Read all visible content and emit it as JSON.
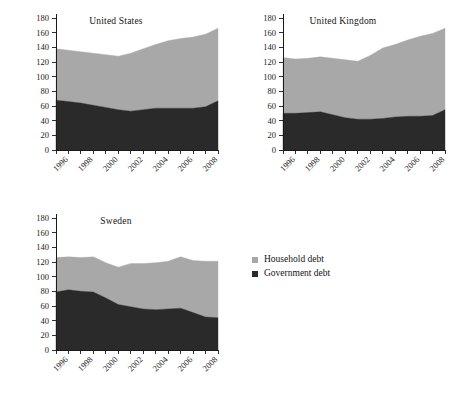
{
  "figure": {
    "width": 459,
    "height": 396
  },
  "legend": {
    "name": "chart-legend",
    "position": "bottom-right",
    "entries": [
      {
        "label": "Household debt",
        "color": "#a8a8a8"
      },
      {
        "label": "Government debt",
        "color": "#2a2a2a"
      }
    ]
  },
  "axis": {
    "ylabel": "",
    "xlabel": "",
    "ylim": [
      0,
      180
    ],
    "yticks": [
      0,
      20,
      40,
      60,
      80,
      100,
      120,
      140,
      160,
      180
    ],
    "xticks_all": [
      1995,
      1996,
      1997,
      1998,
      1999,
      2000,
      2001,
      2002,
      2003,
      2004,
      2005,
      2006,
      2007,
      2008
    ],
    "xtick_labels": [
      "1996",
      "1998",
      "2000",
      "2002",
      "2004",
      "2006",
      "2008"
    ],
    "xtick_labeled_years": [
      1996,
      1998,
      2000,
      2002,
      2004,
      2006,
      2008
    ],
    "grid": false
  },
  "chart_data": [
    {
      "type": "area",
      "stacked": true,
      "title": "United States",
      "xlabel": "",
      "ylabel": "",
      "ylim": [
        0,
        180
      ],
      "x": [
        1995,
        1996,
        1997,
        1998,
        1999,
        2000,
        2001,
        2002,
        2003,
        2004,
        2005,
        2006,
        2007,
        2008
      ],
      "series": [
        {
          "name": "Government debt",
          "color": "#2a2a2a",
          "values": [
            68,
            66,
            64,
            61,
            58,
            55,
            53,
            55,
            57,
            57,
            57,
            57,
            59,
            67
          ]
        },
        {
          "name": "Household debt",
          "color": "#a8a8a8",
          "values": [
            70,
            70,
            70,
            71,
            72,
            73,
            79,
            83,
            87,
            92,
            95,
            97,
            99,
            99
          ]
        }
      ],
      "totals": [
        138,
        136,
        134,
        132,
        130,
        128,
        132,
        138,
        144,
        149,
        152,
        154,
        158,
        166
      ]
    },
    {
      "type": "area",
      "stacked": true,
      "title": "United Kingdom",
      "xlabel": "",
      "ylabel": "",
      "ylim": [
        0,
        180
      ],
      "x": [
        1995,
        1996,
        1997,
        1998,
        1999,
        2000,
        2001,
        2002,
        2003,
        2004,
        2005,
        2006,
        2007,
        2008
      ],
      "series": [
        {
          "name": "Government debt",
          "color": "#2a2a2a",
          "values": [
            50,
            50,
            51,
            52,
            48,
            44,
            42,
            42,
            43,
            45,
            46,
            46,
            47,
            55
          ]
        },
        {
          "name": "Household debt",
          "color": "#a8a8a8",
          "values": [
            76,
            74,
            74,
            75,
            77,
            79,
            79,
            87,
            96,
            99,
            104,
            109,
            112,
            111
          ]
        }
      ],
      "totals": [
        126,
        124,
        125,
        127,
        125,
        123,
        121,
        129,
        139,
        144,
        150,
        155,
        159,
        166
      ]
    },
    {
      "type": "area",
      "stacked": true,
      "title": "Sweden",
      "xlabel": "",
      "ylabel": "",
      "ylim": [
        0,
        180
      ],
      "x": [
        1995,
        1996,
        1997,
        1998,
        1999,
        2000,
        2001,
        2002,
        2003,
        2004,
        2005,
        2006,
        2007,
        2008
      ],
      "series": [
        {
          "name": "Government debt",
          "color": "#2a2a2a",
          "values": [
            79,
            82,
            80,
            79,
            71,
            62,
            59,
            56,
            55,
            56,
            57,
            51,
            45,
            44
          ]
        },
        {
          "name": "Household debt",
          "color": "#a8a8a8",
          "values": [
            47,
            45,
            46,
            48,
            48,
            51,
            59,
            62,
            64,
            65,
            70,
            71,
            76,
            77
          ]
        }
      ],
      "totals": [
        126,
        127,
        126,
        127,
        119,
        113,
        118,
        118,
        119,
        121,
        127,
        122,
        121,
        121
      ]
    }
  ]
}
